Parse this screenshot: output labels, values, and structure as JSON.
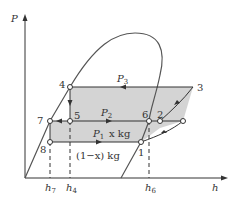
{
  "diagram": {
    "type": "P-h diagram (refrigeration cycle with two-stage throttling)",
    "axes": {
      "y_label": "P",
      "x_label": "h"
    },
    "pressure_lines": [
      {
        "name": "P3",
        "label": "P",
        "sub": "3"
      },
      {
        "name": "P2",
        "label": "P",
        "sub": "2"
      },
      {
        "name": "P1",
        "label": "P",
        "sub": "1"
      }
    ],
    "points": [
      "1",
      "2",
      "3",
      "4",
      "5",
      "6",
      "7",
      "8"
    ],
    "mass_labels": {
      "x": "x kg",
      "one_minus_x": "(1−x) kg"
    },
    "h_ticks": [
      {
        "label": "h",
        "sub": "7"
      },
      {
        "label": "h",
        "sub": "4"
      },
      {
        "label": "h",
        "sub": "6"
      }
    ],
    "colors": {
      "line": "#333333",
      "fill": "#d4d4d4",
      "dome": "#555555"
    }
  }
}
